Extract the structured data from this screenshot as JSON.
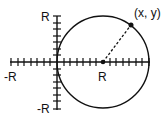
{
  "diagram": {
    "title": "",
    "labels": {
      "y_pos": "R",
      "y_neg": "-R",
      "x_neg": "-R",
      "center": "R",
      "point": "(x, y)"
    },
    "colors": {
      "stroke": "#111111",
      "background": "#ffffff"
    },
    "elements": {
      "axes": "Cartesian axes with tick marks",
      "circle": "Circle of radius R centered at (R, 0), passing through origin",
      "radius_line": "Dashed line from center (R,0) to point (x, y) on circle",
      "center_point": "Filled dot at (R, 0)",
      "point_on_circle": "Filled dot at (x, y)"
    }
  }
}
